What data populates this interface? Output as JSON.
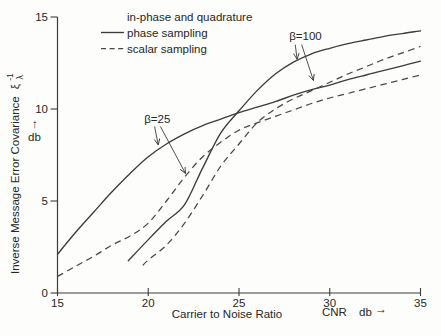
{
  "figure": {
    "background": "#fdfdfb",
    "line_color": "#3c3c3c",
    "text_color": "#262626"
  },
  "legend": {
    "rows": [
      {
        "marker": "none",
        "label": "in-phase and quadrature"
      },
      {
        "marker": "solid",
        "label": "phase sampling"
      },
      {
        "marker": "dashed",
        "label": "scalar sampling"
      }
    ]
  },
  "axes": {
    "y_title": "Inverse Message Error Covariance",
    "y_symbol": "ξ",
    "y_sup": "-1",
    "y_sub": "λ",
    "y_unit": "db",
    "up_arrow": "↑",
    "x_title": "Carrier to Noise Ratio",
    "x_abbrev": "CNR",
    "x_unit": "db",
    "right_arrow": "→"
  },
  "chart_data": {
    "type": "line",
    "title": "",
    "xlabel": "Carrier to Noise Ratio (CNR, db)",
    "ylabel": "Inverse Message Error Covariance ξλ⁻¹ (db)",
    "xlim": [
      15,
      35
    ],
    "ylim": [
      0,
      15
    ],
    "x_ticks": [
      15,
      20,
      25,
      30,
      35
    ],
    "y_ticks": [
      0,
      5,
      10,
      15
    ],
    "grid": false,
    "legend_position": "top-left-inside",
    "series": [
      {
        "name": "phase sampling, β=25",
        "style": "solid",
        "points": [
          [
            15,
            2.1
          ],
          [
            16,
            3.3
          ],
          [
            17,
            4.4
          ],
          [
            18,
            5.5
          ],
          [
            19,
            6.5
          ],
          [
            20,
            7.4
          ],
          [
            21,
            8.1
          ],
          [
            22,
            8.65
          ],
          [
            23,
            9.1
          ],
          [
            24,
            9.45
          ],
          [
            25,
            9.8
          ],
          [
            26,
            10.1
          ],
          [
            27,
            10.4
          ],
          [
            28,
            10.75
          ],
          [
            29,
            11.05
          ],
          [
            30,
            11.3
          ],
          [
            31,
            11.6
          ],
          [
            32,
            11.85
          ],
          [
            33,
            12.1
          ],
          [
            34,
            12.35
          ],
          [
            35,
            12.6
          ]
        ]
      },
      {
        "name": "phase sampling, β=100",
        "style": "solid",
        "points": [
          [
            18.9,
            1.75
          ],
          [
            20,
            2.9
          ],
          [
            21,
            3.9
          ],
          [
            22,
            4.8
          ],
          [
            23,
            6.8
          ],
          [
            24,
            8.7
          ],
          [
            25,
            9.9
          ],
          [
            26,
            11.0
          ],
          [
            27,
            11.9
          ],
          [
            28,
            12.55
          ],
          [
            29,
            13.0
          ],
          [
            30,
            13.3
          ],
          [
            31,
            13.55
          ],
          [
            32,
            13.75
          ],
          [
            33,
            13.95
          ],
          [
            34,
            14.1
          ],
          [
            35,
            14.25
          ]
        ]
      },
      {
        "name": "scalar sampling, β=25",
        "style": "dashed",
        "points": [
          [
            15,
            0.9
          ],
          [
            16,
            1.45
          ],
          [
            17,
            2.0
          ],
          [
            18,
            2.6
          ],
          [
            19,
            3.1
          ],
          [
            20,
            3.8
          ],
          [
            21,
            5.0
          ],
          [
            22,
            6.3
          ],
          [
            23,
            7.4
          ],
          [
            24,
            8.2
          ],
          [
            25,
            8.85
          ],
          [
            26,
            9.25
          ],
          [
            27,
            9.6
          ],
          [
            28,
            9.95
          ],
          [
            29,
            10.3
          ],
          [
            30,
            10.6
          ],
          [
            31,
            10.85
          ],
          [
            32,
            11.1
          ],
          [
            33,
            11.35
          ],
          [
            34,
            11.6
          ],
          [
            35,
            11.85
          ]
        ]
      },
      {
        "name": "scalar sampling, β=100",
        "style": "dashed",
        "points": [
          [
            19.7,
            1.5
          ],
          [
            20,
            1.8
          ],
          [
            21,
            2.6
          ],
          [
            22,
            3.8
          ],
          [
            23,
            5.3
          ],
          [
            24,
            6.9
          ],
          [
            25,
            8.1
          ],
          [
            26,
            9.25
          ],
          [
            27,
            10.0
          ],
          [
            28,
            10.55
          ],
          [
            29,
            11.0
          ],
          [
            30,
            11.45
          ],
          [
            31,
            11.9
          ],
          [
            32,
            12.3
          ],
          [
            33,
            12.7
          ],
          [
            34,
            13.05
          ],
          [
            35,
            13.4
          ]
        ]
      }
    ],
    "annotations": [
      {
        "label": "β=25",
        "x": 20.5,
        "y": 9.46,
        "arrows": [
          {
            "from": [
              20.35,
              9.05
            ],
            "to": [
              20.55,
              8.05
            ]
          },
          {
            "from": [
              20.67,
              9.05
            ],
            "to": [
              22.05,
              6.5
            ]
          }
        ]
      },
      {
        "label": "β=100",
        "x": 28.66,
        "y": 13.97,
        "arrows": [
          {
            "from": [
              28.1,
              13.5
            ],
            "to": [
              28.2,
              12.7
            ]
          },
          {
            "from": [
              28.45,
              13.5
            ],
            "to": [
              29.1,
              11.55
            ]
          }
        ]
      }
    ]
  }
}
